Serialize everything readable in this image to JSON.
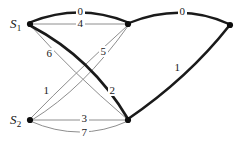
{
  "figure": {
    "background_color": "#ffffff",
    "ink_color": "#141414",
    "thin_edge_color": "#8c8c8c",
    "thick_edge_color": "#1a1a1a"
  },
  "nodes": [
    {
      "id": "s1",
      "label": "S",
      "subscript": "1",
      "x": 30,
      "y": 24,
      "has_text_label": true
    },
    {
      "id": "top_mid",
      "label": "",
      "subscript": "",
      "x": 128,
      "y": 24,
      "has_text_label": false
    },
    {
      "id": "right",
      "label": "",
      "subscript": "",
      "x": 230,
      "y": 25,
      "has_text_label": false
    },
    {
      "id": "s2",
      "label": "S",
      "subscript": "2",
      "x": 30,
      "y": 120,
      "has_text_label": true
    },
    {
      "id": "bot_mid",
      "label": "",
      "subscript": "",
      "x": 128,
      "y": 120,
      "has_text_label": false
    }
  ],
  "edges": [
    {
      "id": "e-s1-topmid-0",
      "from": "s1",
      "to": "top_mid",
      "weight": "0",
      "style": "thick",
      "label_x": 79,
      "label_y": 12
    },
    {
      "id": "e-s1-topmid-4",
      "from": "s1",
      "to": "top_mid",
      "weight": "4",
      "style": "thin",
      "label_x": 79,
      "label_y": 25
    },
    {
      "id": "e-topmid-right-0",
      "from": "top_mid",
      "to": "right",
      "weight": "0",
      "style": "thick",
      "label_x": 181,
      "label_y": 12
    },
    {
      "id": "e-botmid-right-1",
      "from": "bot_mid",
      "to": "right",
      "weight": "1",
      "style": "thick",
      "label_x": 176,
      "label_y": 68
    },
    {
      "id": "e-s1-botmid-2",
      "from": "s1",
      "to": "bot_mid",
      "weight": "2",
      "style": "thick",
      "label_x": 111,
      "label_y": 91
    },
    {
      "id": "e-s1-botmid-6",
      "from": "s1",
      "to": "bot_mid",
      "weight": "6",
      "style": "thin",
      "label_x": 48,
      "label_y": 54
    },
    {
      "id": "e-s2-topmid-1",
      "from": "s2",
      "to": "top_mid",
      "weight": "1",
      "style": "thin",
      "label_x": 45,
      "label_y": 91
    },
    {
      "id": "e-s2-topmid-5",
      "from": "s2",
      "to": "top_mid",
      "weight": "5",
      "style": "thin",
      "label_x": 102,
      "label_y": 52
    },
    {
      "id": "e-s2-botmid-3",
      "from": "s2",
      "to": "bot_mid",
      "weight": "3",
      "style": "thin",
      "label_x": 83,
      "label_y": 119
    },
    {
      "id": "e-s2-botmid-7",
      "from": "s2",
      "to": "bot_mid",
      "weight": "7",
      "style": "thin",
      "label_x": 83,
      "label_y": 133
    }
  ]
}
